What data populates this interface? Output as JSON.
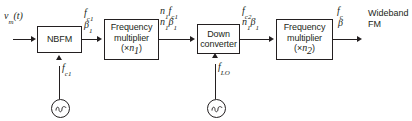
{
  "diagram": {
    "ink_color": "#231f20",
    "background": "#ffffff",
    "input": {
      "label": "vm(t)",
      "base": "v",
      "sub": "m",
      "suffix": "(t)"
    },
    "blocks": [
      {
        "id": "nbfm",
        "lines": [
          "NBFM"
        ]
      },
      {
        "id": "freq-mult-1",
        "lines": [
          "Frequency",
          "multiplier",
          "(×n1)"
        ],
        "line1": "Frequency",
        "line2": "multiplier",
        "mult_prefix": "(×",
        "mult_var": "n",
        "mult_sub": "1",
        "mult_suffix": ")"
      },
      {
        "id": "down-converter",
        "lines": [
          "Down",
          "converter"
        ],
        "line1": "Down",
        "line2": "converter"
      },
      {
        "id": "freq-mult-2",
        "lines": [
          "Frequency",
          "multiplier",
          "(×n2)"
        ],
        "line1": "Frequency",
        "line2": "multiplier",
        "mult_prefix": "(×",
        "mult_var": "n",
        "mult_sub": "2",
        "mult_suffix": ")"
      }
    ],
    "signal_labels": [
      {
        "id": "after-nbfm",
        "freq_var": "f",
        "freq_sub": "c1",
        "beta_var": "β",
        "beta_sub": "1"
      },
      {
        "id": "after-mult-1",
        "freq_prefix_var": "n",
        "freq_prefix_sub": "1",
        "freq_var": "f",
        "freq_sub": "c1",
        "beta_prefix_var": "n",
        "beta_prefix_sub": "1",
        "beta_var": "β",
        "beta_sub": "1"
      },
      {
        "id": "after-down-converter",
        "freq_var": "f",
        "freq_sub": "c2",
        "beta_prefix_var": "n",
        "beta_prefix_sub": "1",
        "beta_var": "β",
        "beta_sub": "1"
      },
      {
        "id": "output",
        "freq_var": "f",
        "freq_sub": "c",
        "beta_var": "β",
        "beta_sub": ""
      }
    ],
    "oscillators": [
      {
        "id": "carrier-oscillator",
        "label_var": "f",
        "label_sub": "c1",
        "symbol": "sine-wave"
      },
      {
        "id": "local-oscillator",
        "label_var": "f",
        "label_sub": "LO",
        "symbol": "sine-wave"
      }
    ],
    "output": {
      "line1": "Wideband",
      "line2": "FM"
    }
  }
}
